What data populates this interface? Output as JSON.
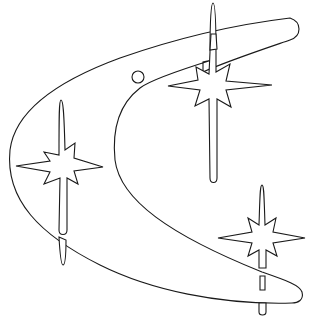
{
  "image": {
    "title": "Boomerang with sparkle stars line art",
    "width": 311,
    "height": 321,
    "background": "#ffffff",
    "stroke_color": "#1a1a1a"
  },
  "elements": {
    "boomerang": {
      "label": "boomerang shape"
    },
    "circle": {
      "label": "small circle",
      "cx": 138,
      "cy": 77,
      "r": 6
    },
    "stars": [
      {
        "label": "star top right",
        "cx": 213,
        "cy": 85
      },
      {
        "label": "star left",
        "cx": 62,
        "cy": 165
      },
      {
        "label": "star bottom right",
        "cx": 262,
        "cy": 238
      }
    ],
    "slots": [
      {
        "label": "slot top"
      },
      {
        "label": "slot bottom"
      }
    ]
  }
}
